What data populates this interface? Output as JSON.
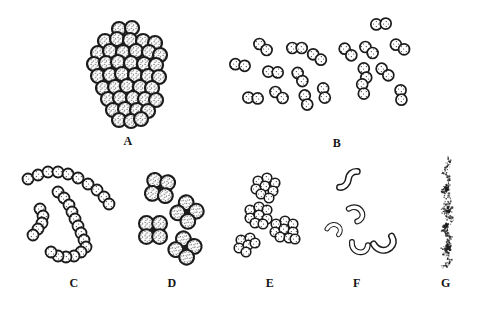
{
  "figure": {
    "name": "bacterial-morphology-plate",
    "ink": "#1b1b1b",
    "paper": "#ffffff",
    "width": 477,
    "height": 310
  },
  "labels": {
    "a": "A",
    "b": "B",
    "c": "C",
    "d": "D",
    "e": "E",
    "f": "F",
    "g": "G"
  },
  "panels": [
    {
      "key": "a",
      "label": "A",
      "arrangement": "dense-cluster-of-cocci"
    },
    {
      "key": "b",
      "label": "B",
      "arrangement": "paired-cocci"
    },
    {
      "key": "c",
      "label": "C",
      "arrangement": "chains-of-cocci"
    },
    {
      "key": "d",
      "label": "D",
      "arrangement": "tetrads-of-cocci"
    },
    {
      "key": "e",
      "label": "E",
      "arrangement": "packet-clusters-of-cocci"
    },
    {
      "key": "f",
      "label": "F",
      "arrangement": "curved-rods"
    },
    {
      "key": "g",
      "label": "G",
      "arrangement": "stippled-filament"
    }
  ],
  "drawing": {
    "cluster_a": {
      "radius": 7,
      "stroke": 2.2,
      "centers": [
        [
          119,
          29
        ],
        [
          132,
          28
        ],
        [
          105,
          41
        ],
        [
          117,
          39
        ],
        [
          130,
          40
        ],
        [
          143,
          41
        ],
        [
          155,
          43
        ],
        [
          98,
          53
        ],
        [
          110,
          51
        ],
        [
          123,
          52
        ],
        [
          136,
          51
        ],
        [
          149,
          52
        ],
        [
          160,
          55
        ],
        [
          94,
          64
        ],
        [
          106,
          63
        ],
        [
          118,
          62
        ],
        [
          131,
          63
        ],
        [
          144,
          64
        ],
        [
          156,
          65
        ],
        [
          98,
          76
        ],
        [
          110,
          75
        ],
        [
          122,
          74
        ],
        [
          135,
          75
        ],
        [
          148,
          76
        ],
        [
          159,
          77
        ],
        [
          103,
          88
        ],
        [
          115,
          87
        ],
        [
          127,
          86
        ],
        [
          140,
          87
        ],
        [
          152,
          88
        ],
        [
          108,
          99
        ],
        [
          120,
          98
        ],
        [
          133,
          98
        ],
        [
          145,
          99
        ],
        [
          156,
          100
        ],
        [
          113,
          110
        ],
        [
          125,
          109
        ],
        [
          137,
          110
        ],
        [
          148,
          111
        ],
        [
          119,
          120
        ],
        [
          131,
          121
        ],
        [
          141,
          119
        ]
      ]
    },
    "pairs_b": {
      "radius": 5.5,
      "gap": 4.7,
      "stroke": 1.7,
      "pairs": [
        [
          263,
          47,
          40
        ],
        [
          297,
          48,
          0
        ],
        [
          317,
          57,
          35
        ],
        [
          240,
          65,
          10
        ],
        [
          273,
          72,
          5
        ],
        [
          300,
          77,
          60
        ],
        [
          348,
          52,
          45
        ],
        [
          369,
          50,
          40
        ],
        [
          381,
          24,
          -5
        ],
        [
          400,
          47,
          30
        ],
        [
          365,
          73,
          75
        ],
        [
          385,
          72,
          45
        ],
        [
          363,
          89,
          80
        ],
        [
          401,
          95,
          85
        ],
        [
          253,
          98,
          5
        ],
        [
          279,
          95,
          40
        ],
        [
          306,
          100,
          75
        ],
        [
          324,
          93,
          80
        ]
      ]
    },
    "chains_c": {
      "radius": 5.5,
      "stroke": 1.8,
      "chains": [
        [
          [
            28,
            179
          ],
          [
            38,
            175
          ],
          [
            48,
            172
          ],
          [
            58,
            172
          ],
          [
            68,
            174
          ],
          [
            78,
            178
          ],
          [
            88,
            184
          ],
          [
            97,
            190
          ],
          [
            104,
            197
          ],
          [
            109,
            204
          ]
        ],
        [
          [
            58,
            192
          ],
          [
            64,
            198
          ],
          [
            69,
            205
          ],
          [
            72,
            212
          ],
          [
            75,
            219
          ],
          [
            78,
            226
          ],
          [
            81,
            233
          ],
          [
            84,
            240
          ],
          [
            86,
            247
          ],
          [
            81,
            252
          ],
          [
            74,
            256
          ],
          [
            66,
            257
          ],
          [
            58,
            256
          ],
          [
            51,
            252
          ]
        ],
        [
          [
            40,
            209
          ],
          [
            43,
            216
          ],
          [
            42,
            223
          ],
          [
            38,
            229
          ],
          [
            33,
            235
          ]
        ]
      ]
    },
    "tetrads_d": {
      "radius": 7.4,
      "offset": 6.6,
      "stroke": 2.1,
      "dot": 1.9,
      "groups": [
        [
          160,
          188,
          10
        ],
        [
          187,
          212,
          40
        ],
        [
          153,
          230,
          0
        ],
        [
          185,
          248,
          35
        ]
      ]
    },
    "packets_e": {
      "radius": 4.8,
      "stroke": 1.6,
      "clusters": [
        {
          "c": [
            265,
            187
          ],
          "offsets": [
            [
              -7,
              -6
            ],
            [
              2,
              -9
            ],
            [
              10,
              -4
            ],
            [
              -9,
              2
            ],
            [
              0,
              -1
            ],
            [
              8,
              4
            ],
            [
              -4,
              7
            ],
            [
              4,
              11
            ]
          ]
        },
        {
          "c": [
            258,
            215
          ],
          "offsets": [
            [
              -8,
              -5
            ],
            [
              1,
              -8
            ],
            [
              9,
              -5
            ],
            [
              -8,
              3
            ],
            [
              1,
              0
            ],
            [
              9,
              4
            ],
            [
              -3,
              8
            ],
            [
              5,
              9
            ]
          ]
        },
        {
          "c": [
            284,
            230
          ],
          "offsets": [
            [
              -8,
              -6
            ],
            [
              1,
              -9
            ],
            [
              9,
              -6
            ],
            [
              -9,
              2
            ],
            [
              0,
              -1
            ],
            [
              9,
              2
            ],
            [
              -4,
              7
            ],
            [
              5,
              8
            ],
            [
              11,
              9
            ]
          ]
        },
        {
          "c": [
            247,
            245
          ],
          "offsets": [
            [
              -6,
              -5
            ],
            [
              3,
              -7
            ],
            [
              -8,
              3
            ],
            [
              1,
              0
            ],
            [
              8,
              -2
            ],
            [
              -1,
              7
            ]
          ]
        }
      ]
    },
    "vibrios_f": {
      "outer": 6.2,
      "inner": 3.7,
      "paths": {
        "p_comma": "M0,10 C0,3 5,-1 11,0 C15,1 17,5 16,9",
        "p_u": "M0,1 C0,8 5,12 11,11 C15,10 17,7 17,3",
        "p_s": "M1,15 C5,15 8,11 8,7 C8,3 11,0 15,0"
      },
      "items": [
        {
          "p": "p_s",
          "x": 340,
          "y": 170,
          "r": 5,
          "s": 1.15
        },
        {
          "p": "p_comma",
          "x": 357,
          "y": 204,
          "r": 60,
          "s": 0.95
        },
        {
          "p": "p_comma",
          "x": 331,
          "y": 222,
          "r": 30,
          "s": 0.8
        },
        {
          "p": "p_u",
          "x": 352,
          "y": 241,
          "r": 5,
          "s": 0.95
        },
        {
          "p": "p_u",
          "x": 373,
          "y": 243,
          "r": -30,
          "s": 1.15
        }
      ]
    },
    "stipple_g": {
      "cx": 447,
      "y0": 156,
      "y1": 268,
      "dots": 300,
      "seed": 7,
      "clumps": [
        [
          447,
          190
        ],
        [
          449,
          210
        ],
        [
          446,
          227
        ],
        [
          448,
          248
        ]
      ],
      "clump_dots": 24
    }
  }
}
